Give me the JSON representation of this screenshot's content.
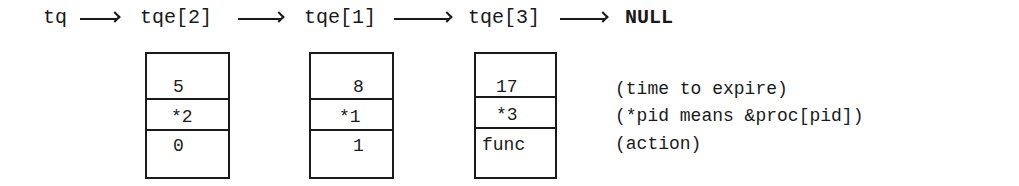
{
  "header": {
    "head_label": "tq",
    "nodes": [
      "tqe[2]",
      "tqe[1]",
      "tqe[3]"
    ],
    "tail_label": "NULL"
  },
  "boxes": [
    {
      "time": "5",
      "pid": "*2",
      "action": "0"
    },
    {
      "time": "8",
      "pid": "*1",
      "action": "1"
    },
    {
      "time": "17",
      "pid": "*3",
      "action": "func"
    }
  ],
  "legend": {
    "time": "(time to expire)",
    "pid": "(*pid means &proc[pid])",
    "action": "(action)"
  }
}
